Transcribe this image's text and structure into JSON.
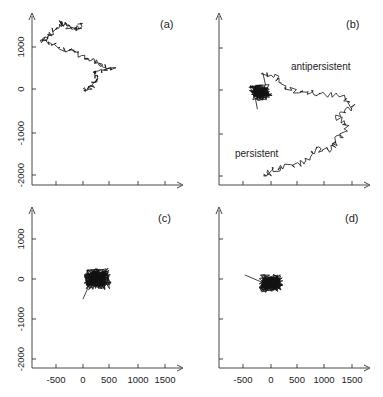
{
  "chart_data": [
    {
      "type": "line",
      "panel": "(a)",
      "title": "",
      "xlabel": "",
      "ylabel": "",
      "xlim": [
        -900,
        1800
      ],
      "ylim": [
        -2200,
        1700
      ],
      "x_ticks": [
        -500,
        0,
        500,
        1000,
        1500
      ],
      "y_ticks": [
        1000,
        0,
        -1000,
        -2000
      ],
      "show_x_tick_labels": false,
      "show_y_tick_labels": true,
      "description": "2D random-walk trajectory wandering from about (0,0) up-left to about (-700,1100), with a long excursion spanning x -750..550, y 0..1550",
      "anchor_points": [
        [
          0,
          0
        ],
        [
          150,
          50
        ],
        [
          250,
          250
        ],
        [
          200,
          400
        ],
        [
          550,
          500
        ],
        [
          300,
          600
        ],
        [
          100,
          700
        ],
        [
          -200,
          900
        ],
        [
          -500,
          1000
        ],
        [
          -750,
          1150
        ],
        [
          -600,
          1300
        ],
        [
          -400,
          1550
        ],
        [
          -300,
          1500
        ],
        [
          -100,
          1400
        ],
        [
          -50,
          1550
        ]
      ],
      "annotations": []
    },
    {
      "type": "line",
      "panel": "(b)",
      "xlim": [
        -900,
        1800
      ],
      "ylim": [
        -2200,
        1700
      ],
      "x_ticks": [
        -500,
        0,
        500,
        1000,
        1500
      ],
      "y_ticks": [
        1000,
        0,
        -1000,
        -2000
      ],
      "show_x_tick_labels": false,
      "show_y_tick_labels": false,
      "description": "Long trajectory: antipersistent dense cluster near (-200,0) and persistent long arc sweeping right to ~1400 and down to ~-2000",
      "anchor_points": [
        [
          -200,
          -400
        ],
        [
          -100,
          -100
        ],
        [
          -250,
          0
        ],
        [
          -150,
          400
        ],
        [
          100,
          300
        ],
        [
          300,
          0
        ],
        [
          700,
          -50
        ],
        [
          1000,
          -100
        ],
        [
          1300,
          -150
        ],
        [
          1500,
          -400
        ],
        [
          1200,
          -600
        ],
        [
          1400,
          -900
        ],
        [
          1200,
          -1200
        ],
        [
          1100,
          -1400
        ],
        [
          800,
          -1400
        ],
        [
          600,
          -1700
        ],
        [
          300,
          -1800
        ],
        [
          0,
          -1900
        ],
        [
          -100,
          -2050
        ]
      ],
      "annotations": [
        "antipersistent",
        "persistent"
      ]
    },
    {
      "type": "line",
      "panel": "(c)",
      "xlim": [
        -900,
        1800
      ],
      "ylim": [
        -2200,
        1700
      ],
      "x_ticks": [
        -500,
        0,
        500,
        1000,
        1500
      ],
      "y_ticks": [
        1000,
        0,
        -1000,
        -2000
      ],
      "show_x_tick_labels": true,
      "show_y_tick_labels": true,
      "description": "Dense compact cluster centered near (250,0), radius ~300, tail to (0,-500)",
      "center": [
        250,
        0
      ],
      "radius": 300,
      "annotations": []
    },
    {
      "type": "line",
      "panel": "(d)",
      "xlim": [
        -900,
        1800
      ],
      "ylim": [
        -2200,
        1700
      ],
      "x_ticks": [
        -500,
        0,
        500,
        1000,
        1500
      ],
      "y_ticks": [
        1000,
        0,
        -1000,
        -2000
      ],
      "show_x_tick_labels": true,
      "show_y_tick_labels": false,
      "description": "Dense compact cluster centered near (0,-100), radius ~250, short tail to (-500,100)",
      "center": [
        0,
        -100
      ],
      "radius": 250,
      "annotations": []
    }
  ],
  "labels": {
    "panel_a": "(a)",
    "panel_b": "(b)",
    "panel_c": "(c)",
    "panel_d": "(d)",
    "antipersistent": "antipersistent",
    "persistent": "persistent",
    "x_ticks": [
      "-500",
      "0",
      "500",
      "1000",
      "1500"
    ],
    "y_ticks": [
      "1000",
      "0",
      "-1000",
      "-2000"
    ]
  }
}
